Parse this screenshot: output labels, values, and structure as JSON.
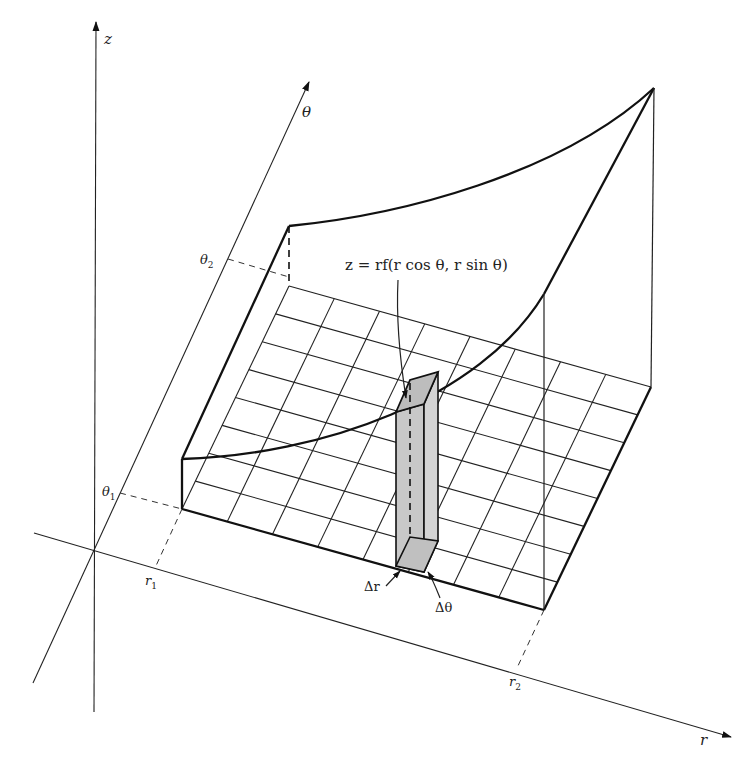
{
  "figure": {
    "axes": {
      "z": {
        "label": "z"
      },
      "theta": {
        "label": "θ"
      },
      "r": {
        "label": "r"
      }
    },
    "ticks": {
      "r1": {
        "base": "r",
        "sub": "1"
      },
      "r2": {
        "base": "r",
        "sub": "2"
      },
      "theta1": {
        "base": "θ",
        "sub": "1"
      },
      "theta2": {
        "base": "θ",
        "sub": "2"
      }
    },
    "annotations": {
      "surface_equation": "z = rf(r cos θ, r sin θ)",
      "delta_r": "Δr",
      "delta_theta": "Δθ"
    },
    "grid": {
      "r_divisions": 8,
      "theta_divisions": 8
    },
    "colors": {
      "line": "#111111",
      "column_fill": "#c8c8c8",
      "column_top_fill": "#bdbdbd",
      "background": "#ffffff"
    }
  }
}
